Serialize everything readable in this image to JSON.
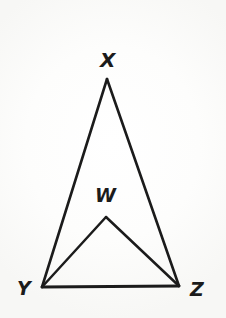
{
  "figure": {
    "kind": "geometry-diagram",
    "canvas": {
      "width": 226,
      "height": 318
    },
    "background_color": "#fbfbfa",
    "stroke_color": "#1b1b1b",
    "stroke_width": 2.6,
    "label_color": "#1b1b1b",
    "label_font_size": 19,
    "points": {
      "X": {
        "x": 107,
        "y": 79
      },
      "Y": {
        "x": 42,
        "y": 287
      },
      "Z": {
        "x": 179,
        "y": 286
      },
      "W": {
        "x": 106,
        "y": 217
      }
    },
    "segments": [
      {
        "name": "XY",
        "from": "X",
        "to": "Y"
      },
      {
        "name": "XZ",
        "from": "X",
        "to": "Z"
      },
      {
        "name": "YZ",
        "from": "Y",
        "to": "Z"
      },
      {
        "name": "WY",
        "from": "W",
        "to": "Y"
      },
      {
        "name": "WZ",
        "from": "W",
        "to": "Z"
      }
    ],
    "labels": [
      {
        "id": "X",
        "text": "X",
        "x": 100,
        "y": 50,
        "font_size": 20
      },
      {
        "id": "W",
        "text": "W",
        "x": 95,
        "y": 186,
        "font_size": 19
      },
      {
        "id": "Y",
        "text": "Y",
        "x": 17,
        "y": 279,
        "font_size": 19
      },
      {
        "id": "Z",
        "text": "Z",
        "x": 190,
        "y": 280,
        "font_size": 19
      }
    ]
  }
}
